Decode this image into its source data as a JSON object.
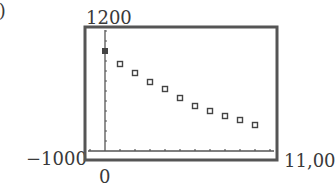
{
  "panel_label": "a)",
  "window": {
    "ymax_label": "1200",
    "xmin_label": "−1000",
    "xmax_label": "11,00",
    "ymin_label": "0"
  },
  "chart_data": {
    "type": "scatter",
    "title": "",
    "xlabel": "",
    "ylabel": "",
    "xlim": [
      -1000,
      11000
    ],
    "ylim": [
      0,
      1200
    ],
    "grid": false,
    "x_tick_interval": 1000,
    "y_tick_interval": 100,
    "series": [
      {
        "name": "data",
        "x": [
          0,
          1000,
          2000,
          3000,
          4000,
          5000,
          6000,
          7000,
          8000,
          9000,
          10000
        ],
        "y": [
          1000,
          870,
          780,
          690,
          620,
          530,
          450,
          400,
          350,
          310,
          260
        ]
      }
    ]
  }
}
